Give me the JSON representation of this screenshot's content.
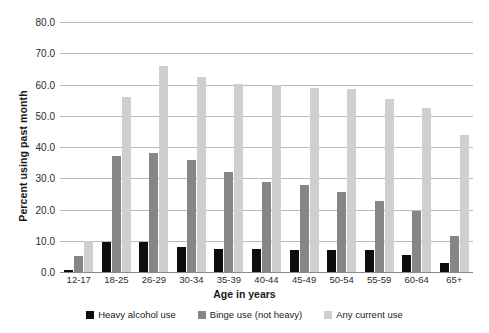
{
  "chart_data": {
    "type": "bar",
    "title": "",
    "xlabel": "Age in years",
    "ylabel": "Percent using past month",
    "ylim": [
      0,
      80
    ],
    "ytick_step": 10,
    "ytick_labels": [
      "80.0",
      "70.0",
      "60.0",
      "50.0",
      "40.0",
      "30.0",
      "20.0",
      "10.0",
      "0.0"
    ],
    "ytick_values": [
      80,
      70,
      60,
      50,
      40,
      30,
      20,
      10,
      0
    ],
    "grid": true,
    "legend_position": "bottom",
    "categories": [
      "12-17",
      "18-25",
      "26-29",
      "30-34",
      "35-39",
      "40-44",
      "45-49",
      "50-54",
      "55-59",
      "60-64",
      "65+"
    ],
    "series": [
      {
        "name": "Heavy alcohol use",
        "color": "#0d0d0d",
        "values": [
          0.7,
          9.5,
          9.6,
          8.0,
          7.5,
          7.3,
          7.1,
          7.0,
          6.9,
          5.3,
          3.0
        ]
      },
      {
        "name": "Binge use (not heavy)",
        "color": "#868686",
        "values": [
          5.1,
          37.0,
          38.2,
          36.0,
          32.0,
          28.8,
          27.9,
          25.7,
          22.6,
          19.4,
          11.6
        ]
      },
      {
        "name": "Any current use",
        "color": "#cfcfcf",
        "values": [
          9.9,
          56.0,
          66.0,
          62.3,
          60.3,
          60.0,
          59.0,
          58.6,
          55.4,
          52.6,
          43.8
        ]
      }
    ]
  },
  "legend": {
    "items": [
      {
        "label": "Heavy alcohol use",
        "key": "heavy"
      },
      {
        "label": "Binge use (not heavy)",
        "key": "binge"
      },
      {
        "label": "Any current use",
        "key": "any"
      }
    ]
  },
  "colors": {
    "heavy": "#0d0d0d",
    "binge": "#868686",
    "any": "#cfcfcf",
    "gridline": "#b9b9b9",
    "axis": "#8a8a8a",
    "background": "#ffffff"
  }
}
